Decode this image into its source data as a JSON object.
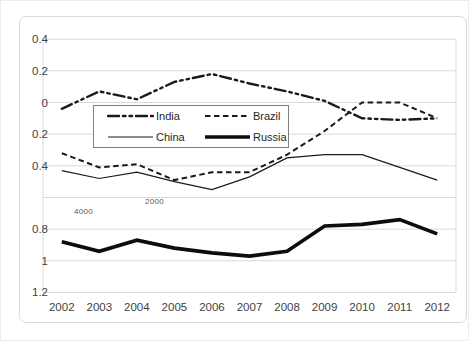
{
  "chart_data": {
    "type": "line",
    "title": "",
    "xlabel": "",
    "ylabel": "",
    "x_categories": [
      "2002",
      "2003",
      "2004",
      "2005",
      "2006",
      "2007",
      "2008",
      "2009",
      "2010",
      "2011",
      "2012"
    ],
    "y_ticks": [
      {
        "value": 0.4,
        "label": "0.4"
      },
      {
        "value": 0.2,
        "label": "0.2"
      },
      {
        "value": 0.0,
        "label": "0"
      },
      {
        "value": -0.2,
        "label": "0.2"
      },
      {
        "value": -0.4,
        "label": "0.4"
      },
      {
        "value": -0.6,
        "label": ""
      },
      {
        "value": -0.8,
        "label": "0.8"
      },
      {
        "value": -1.0,
        "label": "1"
      },
      {
        "value": -1.2,
        "label": "1.2"
      }
    ],
    "ylim": [
      0.4,
      -1.2
    ],
    "grid": true,
    "legend_position": "inside-upper-center",
    "series": [
      {
        "name": "India",
        "style": "dash-dot-dot",
        "width": 2.4,
        "color": "#1a1a1a",
        "values": [
          -0.04,
          0.07,
          0.02,
          0.13,
          0.18,
          0.12,
          0.07,
          0.01,
          -0.1,
          -0.11,
          -0.1
        ]
      },
      {
        "name": "Brazil",
        "style": "dashed",
        "width": 2.0,
        "color": "#1a1a1a",
        "values": [
          -0.32,
          -0.41,
          -0.39,
          -0.49,
          -0.44,
          -0.44,
          -0.33,
          -0.18,
          0.0,
          0.0,
          -0.1
        ]
      },
      {
        "name": "China",
        "style": "solid",
        "width": 1.2,
        "color": "#1a1a1a",
        "values": [
          -0.43,
          -0.48,
          -0.44,
          -0.5,
          -0.55,
          -0.47,
          -0.35,
          -0.33,
          -0.33,
          -0.41,
          -0.49
        ]
      },
      {
        "name": "Russia",
        "style": "solid",
        "width": 3.6,
        "color": "#0d0d0d",
        "values": [
          -0.88,
          -0.94,
          -0.87,
          -0.92,
          -0.95,
          -0.97,
          -0.94,
          -0.78,
          -0.77,
          -0.74,
          -0.83
        ]
      }
    ],
    "annotations": [
      {
        "text": "4000",
        "x": 73,
        "y": 206
      },
      {
        "text": "2000",
        "x": 144,
        "y": 196
      }
    ],
    "colors": {
      "gridline": "#d9d9d9",
      "axis_text": "#3f3f3f",
      "frame_border": "#d9d9d9",
      "legend_border": "#7f7f7f"
    }
  },
  "legend": {
    "items": [
      {
        "label": "India"
      },
      {
        "label": "Brazil"
      },
      {
        "label": "China"
      },
      {
        "label": "Russia"
      }
    ]
  }
}
